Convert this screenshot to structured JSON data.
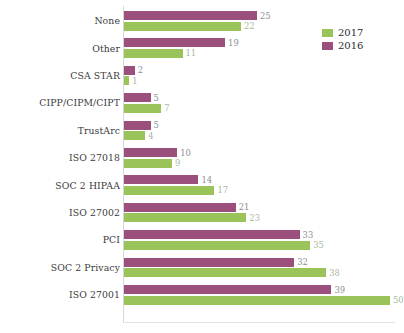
{
  "chart_data": {
    "type": "bar",
    "orientation": "horizontal",
    "title": "",
    "subtitle": "",
    "xlabel": "",
    "ylabel": "",
    "grid": false,
    "xlim": [
      0,
      50
    ],
    "legend_position": "top-right",
    "categories": [
      "None",
      "Other",
      "CSA STAR",
      "CIPP/CIPM/CIPT",
      "TrustArc",
      "ISO 27018",
      "SOC 2 HIPAA",
      "ISO 27002",
      "PCI",
      "SOC 2 Privacy",
      "ISO 27001"
    ],
    "series": [
      {
        "name": "2016",
        "color": "#9B4F7D",
        "values": [
          25,
          19,
          2,
          5,
          5,
          10,
          14,
          21,
          33,
          32,
          39
        ]
      },
      {
        "name": "2017",
        "color": "#9AC45A",
        "values": [
          22,
          11,
          1,
          7,
          4,
          9,
          17,
          23,
          35,
          38,
          50
        ]
      }
    ]
  },
  "legend": {
    "entries": [
      {
        "label": "2017",
        "color": "#9AC45A"
      },
      {
        "label": "2016",
        "color": "#9B4F7D"
      }
    ]
  },
  "colors": {
    "series_2016": "#9B4F7D",
    "series_2017": "#9AC45A",
    "axis": "#d8d8d8",
    "label_text": "#3a3a3a",
    "value_2016_text": "#8e8e96",
    "value_2017_text": "#a8b8a0",
    "background": "#ffffff"
  }
}
